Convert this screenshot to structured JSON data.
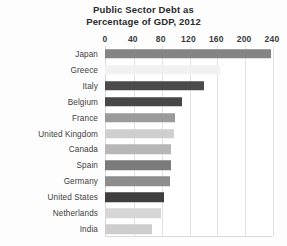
{
  "chart_data": {
    "type": "bar",
    "orientation": "horizontal",
    "title": "Public Sector Debt as Percentage of GDP, 2012",
    "title_lines": [
      "Public Sector Debt as",
      "Percentage of GDP, 2012"
    ],
    "xlabel": "",
    "ylabel": "",
    "xlim": [
      0,
      240
    ],
    "xticks": [
      0,
      40,
      80,
      120,
      160,
      200,
      240
    ],
    "xtick_labels": [
      "0",
      "40",
      "80",
      "120",
      "160",
      "200",
      "240"
    ],
    "grid": true,
    "grid_axis": "x",
    "legend": false,
    "categories": [
      "Japan",
      "Greece",
      "Italy",
      "Belgium",
      "France",
      "United Kingdom",
      "Canada",
      "Spain",
      "Germany",
      "United States",
      "Netherlands",
      "India"
    ],
    "values": [
      238,
      165,
      142,
      110,
      100,
      99,
      95,
      95,
      93,
      85,
      80,
      67
    ],
    "bar_colors": [
      "#848484",
      "#f1f1f1",
      "#4b4b4b",
      "#474747",
      "#9b9b9b",
      "#cfcfcf",
      "#b7b7b7",
      "#7b7b7b",
      "#8d8d8d",
      "#3f3f3f",
      "#d6d6d6",
      "#cdcdcd"
    ]
  },
  "style": {
    "background": "#fdfdfd",
    "plot_background": "#ffffff",
    "gridline_color": "#e2e2e2",
    "axis_color": "#d8d8d8",
    "title_color": "#2b2b2b",
    "tick_label_color": "#3a3a3a",
    "category_label_color": "#3d3d3d"
  }
}
